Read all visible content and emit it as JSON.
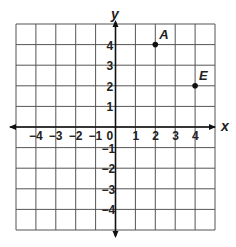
{
  "chart_data": {
    "type": "scatter",
    "title": "",
    "xlabel": "x",
    "ylabel": "y",
    "xlim": [
      -5,
      5
    ],
    "ylim": [
      -5,
      5
    ],
    "grid": true,
    "x_ticks": [
      -4,
      -3,
      -2,
      -1,
      0,
      1,
      2,
      3,
      4
    ],
    "y_ticks": [
      4,
      3,
      2,
      1,
      -1,
      -2,
      -3,
      -4
    ],
    "points": [
      {
        "label": "A",
        "x": 2,
        "y": 4
      },
      {
        "label": "E",
        "x": 4,
        "y": 2
      }
    ]
  },
  "colors": {
    "line": "#333333",
    "grid": "#555555",
    "point": "#111111"
  }
}
